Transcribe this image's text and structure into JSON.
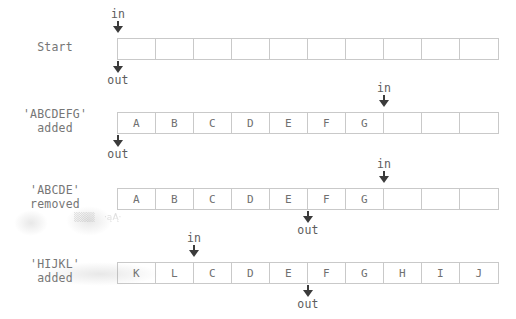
{
  "figure": {
    "cell_count": 10,
    "line_color": "#c9c9c9",
    "text_color": "#6a6a6a",
    "arrow_color": "#3b3b3b",
    "background": "#ffffff"
  },
  "markers": {
    "in_label": "in",
    "out_label": "out"
  },
  "rows": [
    {
      "caption_lines": [
        "Start",
        ""
      ],
      "cells": [
        "",
        "",
        "",
        "",
        "",
        "",
        "",
        "",
        "",
        ""
      ],
      "in_index": 0,
      "out_index": 0,
      "in_label": "in",
      "out_label": "out"
    },
    {
      "caption_lines": [
        "'ABCDEFG'",
        "added"
      ],
      "cells": [
        "A",
        "B",
        "C",
        "D",
        "E",
        "F",
        "G",
        "",
        "",
        ""
      ],
      "in_index": 7,
      "out_index": 0,
      "in_label": "in",
      "out_label": "out"
    },
    {
      "caption_lines": [
        "'ABCDE'",
        "removed"
      ],
      "cells": [
        "A",
        "B",
        "C",
        "D",
        "E",
        "F",
        "G",
        "",
        "",
        ""
      ],
      "in_index": 7,
      "out_index": 5,
      "in_label": "in",
      "out_label": "out"
    },
    {
      "caption_lines": [
        "'HIJKL'",
        "added"
      ],
      "cells": [
        "K",
        "L",
        "C",
        "D",
        "E",
        "F",
        "G",
        "H",
        "I",
        "J"
      ],
      "in_index": 2,
      "out_index": 5,
      "in_label": "in",
      "out_label": "out"
    }
  ],
  "artifacts": [
    {
      "text": "▒▒▒",
      "x": 74,
      "y": 214
    },
    {
      "text": "·ąĄ·",
      "x": 106,
      "y": 214
    }
  ]
}
